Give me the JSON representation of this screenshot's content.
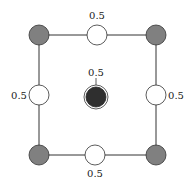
{
  "diagram": {
    "colors": {
      "corner": "#808080",
      "edge": "#ffffff",
      "center": "#2f2f2f",
      "stroke": "#333333"
    },
    "labels": {
      "top": "0.5",
      "left": "0.5",
      "right": "0.5",
      "bottom": "0.5",
      "center": "0.5"
    }
  }
}
